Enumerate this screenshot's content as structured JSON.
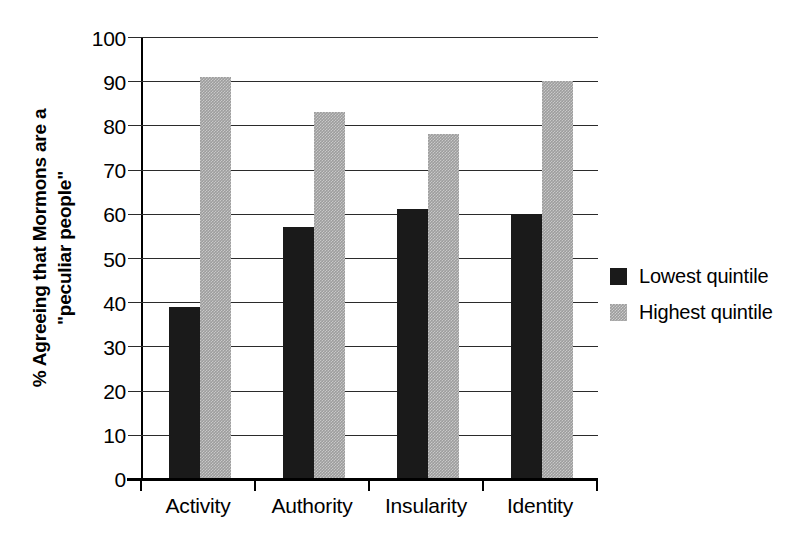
{
  "chart_data": {
    "type": "bar",
    "title": "",
    "subtitle": "",
    "xlabel": "",
    "ylabel_lines": [
      "% Agreeing that Mormons are a",
      "\"peculiar people\""
    ],
    "categories": [
      "Activity",
      "Authority",
      "Insularity",
      "Identity"
    ],
    "series": [
      {
        "name": "Lowest quintile",
        "values": [
          39,
          57,
          61,
          60
        ],
        "color": "#1a1a1a"
      },
      {
        "name": "Highest quintile",
        "values": [
          91,
          83,
          78,
          90
        ],
        "color": "#9d9d9d"
      }
    ],
    "ylim": [
      0,
      100
    ],
    "ytick_labels": [
      "0",
      "10",
      "20",
      "30",
      "40",
      "50",
      "60",
      "70",
      "80",
      "90",
      "100"
    ],
    "ytick_values": [
      0,
      10,
      20,
      30,
      40,
      50,
      60,
      70,
      80,
      90,
      100
    ],
    "grid": "horizontal",
    "legend_position": "right"
  },
  "legend": {
    "entries": [
      {
        "label": "Lowest quintile",
        "swatch": "dark"
      },
      {
        "label": "Highest quintile",
        "swatch": "gray"
      }
    ]
  }
}
